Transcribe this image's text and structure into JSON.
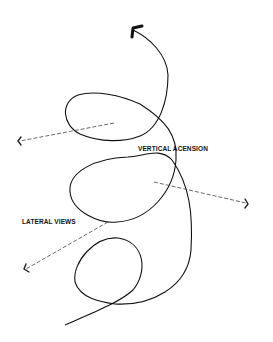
{
  "diagram": {
    "labels": {
      "vertical": "VERTICAL ACENSION",
      "lateral": "LATERAL VIEWS"
    },
    "colors": {
      "stroke": "#111111",
      "dashed": "#444444",
      "background": "#ffffff"
    },
    "elements": [
      {
        "type": "spiral-curve",
        "arrow": "up",
        "description": "Upward spiraling line with arrowhead at top"
      },
      {
        "type": "dashed-arrow",
        "direction": "left",
        "from": "upper loop center"
      },
      {
        "type": "dashed-arrow",
        "direction": "right",
        "from": "middle loop"
      },
      {
        "type": "dashed-arrow",
        "direction": "down-left",
        "from": "middle loop bottom"
      }
    ]
  }
}
